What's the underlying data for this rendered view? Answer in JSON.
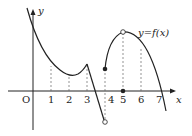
{
  "labels": {
    "origin": "O",
    "y_axis": "y",
    "x_axis": "x",
    "function": "y=f(x)",
    "ticks": [
      "1",
      "2",
      "3",
      "4",
      "5",
      "6",
      "7"
    ]
  },
  "colors": {
    "curve": "#222222",
    "dash": "#666666"
  }
}
